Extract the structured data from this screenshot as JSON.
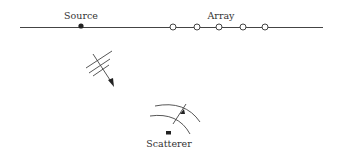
{
  "diagram": {
    "labels": {
      "source": "Source",
      "array": "Array",
      "scatterer": "Scatterer"
    },
    "colors": {
      "line": "#333333",
      "background": "#ffffff"
    },
    "elements": {
      "baseline": "horizontal line",
      "source_marker": "filled dot",
      "array_elements_count": 5,
      "incident_wave": "wavefronts with propagation arrow",
      "scattered_wave": "curved wavefronts with arrow",
      "scatterer_marker": "filled rectangle"
    }
  }
}
